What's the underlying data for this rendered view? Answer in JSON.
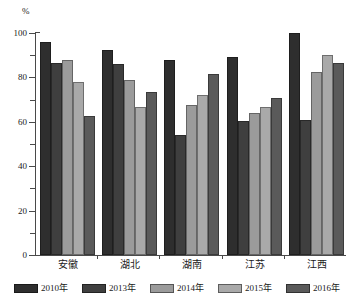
{
  "chart_data": {
    "type": "bar",
    "title": "",
    "subtitle": "",
    "xlabel": "",
    "ylabel": "%",
    "unit_label": "%",
    "ylim": [
      0,
      100
    ],
    "yticks": [
      0,
      20,
      40,
      60,
      80,
      100
    ],
    "ytick_labels": [
      "0",
      "20",
      "40",
      "60",
      "80",
      "100"
    ],
    "minor_ytick_step": 10,
    "grid": false,
    "legend_position": "bottom",
    "orientation": "vertical",
    "categories": [
      "安徽",
      "湖北",
      "湖南",
      "江苏",
      "江西"
    ],
    "series": [
      {
        "name": "2010年",
        "color": "#2e2e2e",
        "values": [
          96.0,
          92.5,
          88.0,
          89.0,
          100.0
        ]
      },
      {
        "name": "2013年",
        "color": "#3f3f3f",
        "values": [
          86.5,
          86.0,
          54.0,
          60.5,
          61.0
        ]
      },
      {
        "name": "2014年",
        "color": "#9b9b9b",
        "values": [
          88.0,
          79.0,
          67.5,
          64.0,
          82.5
        ]
      },
      {
        "name": "2015年",
        "color": "#a9a9a9",
        "values": [
          78.0,
          66.5,
          72.0,
          66.5,
          90.0
        ]
      },
      {
        "name": "2016年",
        "color": "#5a5a5a",
        "values": [
          62.5,
          73.5,
          81.5,
          70.5,
          86.5
        ]
      }
    ]
  },
  "axis": {
    "unit": "%"
  },
  "legend": {
    "items": [
      {
        "label": "2010年"
      },
      {
        "label": "2013年"
      },
      {
        "label": "2014年"
      },
      {
        "label": "2015年"
      },
      {
        "label": "2016年"
      }
    ]
  }
}
